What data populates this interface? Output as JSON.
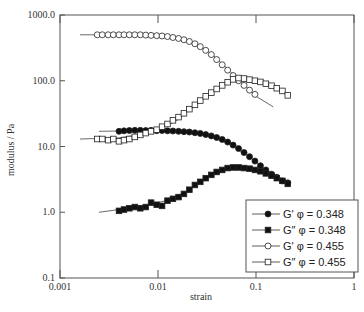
{
  "chart_data": {
    "type": "scatter",
    "title": "",
    "xlabel": "strain",
    "ylabel": "modulus / Pa",
    "xscale": "log",
    "yscale": "log",
    "xlim": [
      0.001,
      1
    ],
    "ylim": [
      0.1,
      1000
    ],
    "x_ticks": [
      0.001,
      0.01,
      0.1,
      1
    ],
    "x_tick_labels": [
      "0.001",
      "0.01",
      "0.1",
      "1"
    ],
    "y_ticks": [
      0.1,
      1,
      10,
      100,
      1000
    ],
    "y_tick_labels": [
      "0.1",
      "1.0",
      "10.0",
      "100.0",
      "1000.0"
    ],
    "grid": false,
    "legend_position": "bottom-right",
    "series": [
      {
        "name": "G′ φ = 0.348",
        "marker": "filled-circle",
        "line_start": 0.0025,
        "x": [
          0.004,
          0.0045,
          0.0051,
          0.0058,
          0.0066,
          0.0075,
          0.0085,
          0.0097,
          0.011,
          0.0125,
          0.0142,
          0.0162,
          0.0184,
          0.0209,
          0.0238,
          0.027,
          0.0307,
          0.035,
          0.0397,
          0.0452,
          0.0514,
          0.0584,
          0.0664,
          0.0755,
          0.0859,
          0.0976,
          0.111,
          0.126,
          0.144,
          0.163,
          0.186,
          0.211
        ],
        "y": [
          17,
          17.3,
          17.5,
          17.6,
          17.6,
          17.5,
          17.6,
          17.4,
          17.5,
          17.3,
          17.2,
          17.0,
          16.8,
          16.6,
          16.2,
          15.8,
          15.2,
          14.5,
          13.7,
          12.8,
          11.7,
          10.5,
          9.3,
          8.1,
          7.0,
          6.0,
          5.1,
          4.4,
          3.8,
          3.4,
          3.0,
          2.8
        ]
      },
      {
        "name": "G″ φ = 0.348",
        "marker": "filled-square",
        "line_start": 0.0025,
        "x": [
          0.004,
          0.0045,
          0.0051,
          0.0058,
          0.0066,
          0.0075,
          0.0085,
          0.0097,
          0.011,
          0.0125,
          0.0142,
          0.0162,
          0.0184,
          0.0209,
          0.0238,
          0.027,
          0.0307,
          0.035,
          0.0397,
          0.0452,
          0.0514,
          0.0584,
          0.0664,
          0.0755,
          0.0859,
          0.0976,
          0.111,
          0.126,
          0.144,
          0.163,
          0.186,
          0.211
        ],
        "y": [
          1.05,
          1.1,
          1.15,
          1.2,
          1.15,
          1.2,
          1.4,
          1.3,
          1.25,
          1.5,
          1.6,
          1.7,
          1.9,
          2.2,
          2.6,
          2.9,
          3.3,
          3.7,
          4.1,
          4.4,
          4.7,
          4.8,
          4.8,
          4.7,
          4.6,
          4.4,
          4.2,
          3.9,
          3.6,
          3.3,
          3.0,
          2.7
        ]
      },
      {
        "name": "G′ φ = 0.455",
        "marker": "open-circle",
        "line_start": 0.0016,
        "x": [
          0.0024,
          0.0027,
          0.0031,
          0.0035,
          0.004,
          0.0045,
          0.0051,
          0.0058,
          0.0066,
          0.0075,
          0.0085,
          0.0097,
          0.011,
          0.0125,
          0.0142,
          0.0162,
          0.0184,
          0.0209,
          0.0238,
          0.027,
          0.0307,
          0.035,
          0.0397,
          0.0452,
          0.0514,
          0.0584,
          0.0664,
          0.0755,
          0.0859,
          0.0976
        ],
        "y": [
          500,
          500,
          500,
          500,
          500,
          500,
          500,
          500,
          500,
          495,
          490,
          485,
          480,
          470,
          455,
          440,
          420,
          395,
          365,
          330,
          290,
          250,
          210,
          175,
          145,
          120,
          100,
          85,
          72,
          62
        ]
      },
      {
        "name": "G″ φ = 0.455",
        "marker": "open-square",
        "line_start": 0.0016,
        "x": [
          0.0024,
          0.0027,
          0.0031,
          0.0035,
          0.004,
          0.0045,
          0.0051,
          0.0058,
          0.0066,
          0.0075,
          0.0085,
          0.0097,
          0.011,
          0.0125,
          0.0142,
          0.0162,
          0.0184,
          0.0209,
          0.0238,
          0.027,
          0.0307,
          0.035,
          0.0397,
          0.0452,
          0.0514,
          0.0584,
          0.0664,
          0.0755,
          0.0859,
          0.0976,
          0.111,
          0.126,
          0.144,
          0.163,
          0.186,
          0.211
        ],
        "y": [
          13,
          13,
          12.5,
          13,
          12,
          12.5,
          13,
          14,
          15,
          16,
          17,
          18,
          20,
          22,
          25,
          28,
          32,
          37,
          43,
          50,
          58,
          66,
          75,
          85,
          95,
          105,
          110,
          108,
          104,
          100,
          96,
          90,
          84,
          77,
          70,
          60
        ]
      }
    ],
    "fit_curves": [
      {
        "series": "G′ φ = 0.348",
        "x": [
          0.0025,
          0.004,
          0.008,
          0.015,
          0.03,
          0.05,
          0.08,
          0.12,
          0.2
        ],
        "y": [
          17,
          17.2,
          17.4,
          17,
          15,
          11.5,
          7.5,
          4.7,
          3
        ]
      },
      {
        "series": "G″ φ = 0.348",
        "x": [
          0.0025,
          0.004,
          0.008,
          0.012,
          0.02,
          0.035,
          0.06,
          0.1,
          0.2
        ],
        "y": [
          1.0,
          1.1,
          1.3,
          1.5,
          2.1,
          3.6,
          4.9,
          4.4,
          2.8
        ]
      },
      {
        "series": "G′ φ = 0.455",
        "x": [
          0.0016,
          0.004,
          0.01,
          0.02,
          0.035,
          0.06,
          0.1,
          0.15
        ],
        "y": [
          500,
          500,
          490,
          410,
          260,
          120,
          58,
          40
        ]
      },
      {
        "series": "G″ φ = 0.455",
        "x": [
          0.0016,
          0.004,
          0.008,
          0.015,
          0.03,
          0.05,
          0.07,
          0.1,
          0.15,
          0.2
        ],
        "y": [
          13,
          13.5,
          16,
          24,
          55,
          95,
          110,
          100,
          80,
          62
        ]
      }
    ],
    "legend": [
      {
        "label": "G′ φ = 0.348",
        "marker": "filled-circle"
      },
      {
        "label": "G″ φ = 0.348",
        "marker": "filled-square"
      },
      {
        "label": "G′ φ = 0.455",
        "marker": "open-circle"
      },
      {
        "label": "G″ φ = 0.455",
        "marker": "open-square"
      }
    ]
  }
}
